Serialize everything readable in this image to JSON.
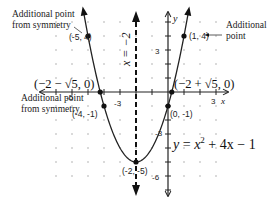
{
  "figure": {
    "equation": "y = x² + 4x − 1",
    "equation_parts": {
      "y": "y",
      "eq": " = ",
      "x": "x",
      "exp": "2",
      "rest": " + 4x − 1"
    },
    "axis_of_symmetry_label": "x = −2",
    "axes": {
      "x_label": "x",
      "y_label": "y"
    },
    "tick_labels": {
      "x_neg3": "-3",
      "x_neg5": "-5",
      "x_3": "3",
      "y_3": "3",
      "y_neg3": "-3",
      "y_neg6": "-6"
    },
    "points": [
      {
        "id": "p1",
        "label": "(-5, 4)",
        "x": -5,
        "y": 4
      },
      {
        "id": "p2",
        "label": "(1, 4)",
        "x": 1,
        "y": 4
      },
      {
        "id": "p3",
        "label": "(-4, -1)",
        "x": -4,
        "y": -1
      },
      {
        "id": "p4",
        "label": "(0, -1)",
        "x": 0,
        "y": -1
      },
      {
        "id": "p5",
        "label": "(-2, -5)",
        "x": -2,
        "y": -5
      }
    ],
    "intercepts": {
      "left": "(−2 − √5, 0)",
      "right": "(−2 + √5, 0)"
    },
    "annotations": {
      "top_left_line1": "Additional point",
      "top_left_line2": "from symmetry",
      "mid_left_line1": "Additional point",
      "mid_left_line2": "from symmetry",
      "top_right_line1": "Additional",
      "top_right_line2": "point"
    },
    "colors": {
      "curve": "#222222",
      "axes": "#222222",
      "grid_dot": "#9a9a9a"
    }
  }
}
